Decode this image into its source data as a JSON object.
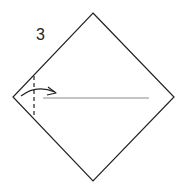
{
  "diagram": {
    "type": "origami-instruction-step",
    "step_number": "3",
    "paper": {
      "shape": "square-rotated-45",
      "vertices": {
        "top": [
          93,
          13
        ],
        "right": [
          174,
          97
        ],
        "bottom": [
          93,
          181
        ],
        "left": [
          13,
          97
        ]
      },
      "stroke_color": "#222222"
    },
    "fold_line": {
      "style": "dashed",
      "orientation": "vertical",
      "x": 34,
      "y_start": 76,
      "y_end": 118,
      "description": "valley fold line near left corner"
    },
    "crease_line": {
      "style": "solid",
      "orientation": "horizontal",
      "y": 98,
      "x_start": 43,
      "x_end": 149,
      "stroke_color": "#888888"
    },
    "arrow": {
      "type": "fold-over-arrow",
      "direction": "right",
      "start": [
        21,
        96
      ],
      "end": [
        56,
        93
      ],
      "description": "fold left corner to the right"
    }
  }
}
